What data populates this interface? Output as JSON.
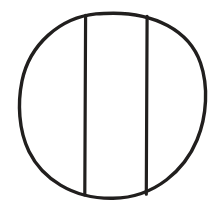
{
  "figure": {
    "style": "line-drawing",
    "canvas": {
      "width": 218,
      "height": 206
    },
    "colors": {
      "background": "#ffffff",
      "stroke": "#211f1e",
      "fill": "none"
    },
    "shapes": [
      {
        "name": "circle-outline",
        "type": "ellipse",
        "cx": 113,
        "cy": 105,
        "rx": 91,
        "ry": 91,
        "stroke_width": 3.4
      },
      {
        "name": "chord-left",
        "type": "line",
        "x1": 85.5,
        "y1": 15.5,
        "x2": 84.5,
        "y2": 195.0,
        "stroke_width": 3.2
      },
      {
        "name": "chord-right",
        "type": "line",
        "x1": 147.0,
        "y1": 16.5,
        "x2": 146.0,
        "y2": 194.0,
        "stroke_width": 3.2
      }
    ],
    "regions": [
      {
        "name": "left-segment",
        "label": ""
      },
      {
        "name": "center-band",
        "label": ""
      },
      {
        "name": "right-segment",
        "label": ""
      }
    ],
    "labels": [],
    "annotations": []
  }
}
